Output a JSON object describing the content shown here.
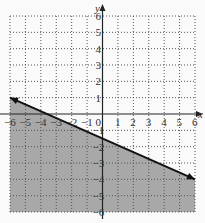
{
  "chart_data": {
    "type": "line",
    "title": "",
    "xlabel": "x",
    "ylabel": "y",
    "xlim": [
      -6,
      6
    ],
    "ylim": [
      -6,
      6
    ],
    "grid": true,
    "grid_style": "dotted",
    "x_ticks": [
      "-6",
      "-5",
      "-4",
      "-3",
      "-2",
      "-1",
      "0",
      "1",
      "2",
      "3",
      "4",
      "5",
      "6"
    ],
    "y_ticks": [
      "6",
      "5",
      "4",
      "3",
      "2",
      "1",
      "-1",
      "-2",
      "-3",
      "-4",
      "-5",
      "-6"
    ],
    "series": [
      {
        "name": "boundary line",
        "style": "solid",
        "x": [
          -6,
          6
        ],
        "y": [
          1,
          -4
        ],
        "equation": "y = -5/12 x - 3/2",
        "arrows": "both ends"
      }
    ],
    "shaded_region": {
      "description": "region below the line (y <= -5/12 x - 3/2)",
      "color": "#a8a8a8"
    },
    "colors": {
      "background": "#fafafa",
      "shade": "#a8a8a8",
      "axis": "#222222",
      "grid": "#555555"
    }
  }
}
